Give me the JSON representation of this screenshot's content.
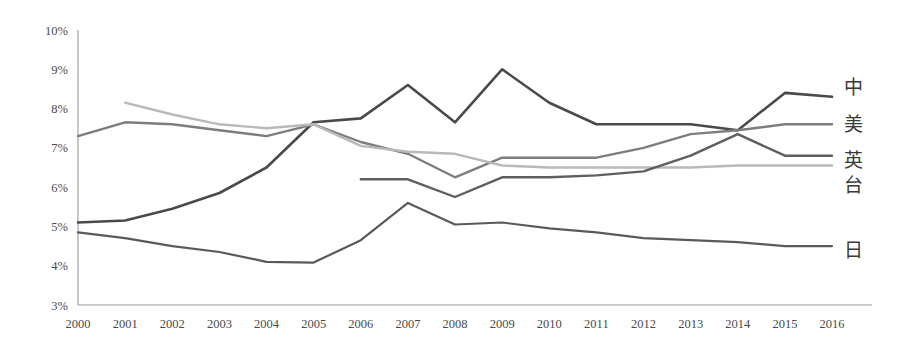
{
  "chart_data": {
    "type": "line",
    "title": "",
    "xlabel": "",
    "ylabel": "",
    "x": [
      2000,
      2001,
      2002,
      2003,
      2004,
      2005,
      2006,
      2007,
      2008,
      2009,
      2010,
      2011,
      2012,
      2013,
      2014,
      2015,
      2016
    ],
    "categories": [
      "2000",
      "2001",
      "2002",
      "2003",
      "2004",
      "2005",
      "2006",
      "2007",
      "2008",
      "2009",
      "2010",
      "2011",
      "2012",
      "2013",
      "2014",
      "2015",
      "2016"
    ],
    "ylim": [
      3,
      10
    ],
    "ytick_labels": [
      "3%",
      "4%",
      "5%",
      "6%",
      "7%",
      "8%",
      "9%",
      "10%"
    ],
    "ytick_values": [
      3,
      4,
      5,
      6,
      7,
      8,
      9,
      10
    ],
    "grid": false,
    "legend_position": "right-inline",
    "series": [
      {
        "name": "中",
        "label": "中",
        "color": "#4a4a4a",
        "width": 2.6,
        "values": [
          5.1,
          5.15,
          5.45,
          5.85,
          6.5,
          7.65,
          7.75,
          8.6,
          7.65,
          9.0,
          8.15,
          7.6,
          7.6,
          7.6,
          7.45,
          8.4,
          8.3
        ],
        "start_year": 2000
      },
      {
        "name": "美",
        "label": "美",
        "color": "#7d7d7d",
        "width": 2.4,
        "values": [
          7.3,
          7.65,
          7.6,
          7.45,
          7.3,
          7.6,
          7.15,
          6.85,
          6.25,
          6.75,
          6.75,
          6.75,
          7.0,
          7.35,
          7.45,
          7.6,
          7.6
        ],
        "start_year": 2000
      },
      {
        "name": "英",
        "label": "英",
        "color": "#b9b9b9",
        "width": 2.4,
        "values": [
          null,
          8.15,
          7.85,
          7.6,
          7.5,
          7.6,
          7.05,
          6.9,
          6.85,
          6.55,
          6.5,
          6.5,
          6.5,
          6.5,
          6.55,
          6.55,
          6.55
        ],
        "start_year": 2001
      },
      {
        "name": "台",
        "label": "台",
        "color": "#5e5e5e",
        "width": 2.4,
        "values": [
          null,
          null,
          null,
          null,
          null,
          null,
          6.2,
          6.2,
          5.75,
          6.25,
          6.25,
          6.3,
          6.4,
          6.8,
          7.35,
          6.8,
          6.8
        ],
        "start_year": 2006
      },
      {
        "name": "日",
        "label": "日",
        "color": "#5a5a5a",
        "width": 2.2,
        "values": [
          4.85,
          4.7,
          4.5,
          4.35,
          4.1,
          4.08,
          4.65,
          5.6,
          5.05,
          5.1,
          4.95,
          4.85,
          4.7,
          4.65,
          4.6,
          4.5,
          4.5
        ],
        "start_year": 2000
      }
    ],
    "legend_labels": [
      {
        "text": "中",
        "y_value": 8.55
      },
      {
        "text": "美",
        "y_value": 7.6
      },
      {
        "text": "英",
        "y_value": 6.7
      },
      {
        "text": "台",
        "y_value": 6.05
      },
      {
        "text": "日",
        "y_value": 4.4
      }
    ],
    "axis_color": "#9a9a9a",
    "background": "#ffffff"
  }
}
